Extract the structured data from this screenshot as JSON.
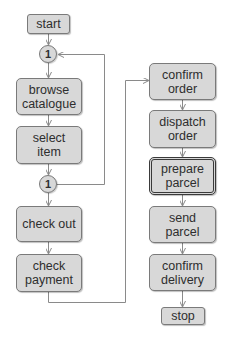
{
  "diagram": {
    "type": "flowchart",
    "colors": {
      "node_fill": "#d8d8d8",
      "node_border": "#7a7a7a",
      "text": "#2e2e2e",
      "line": "#888888"
    },
    "nodes": [
      {
        "id": "start",
        "label": "start",
        "kind": "terminal"
      },
      {
        "id": "c1",
        "label": "1",
        "kind": "connector"
      },
      {
        "id": "browse",
        "label": "browse catalogue",
        "kind": "process"
      },
      {
        "id": "select",
        "label": "select item",
        "kind": "process"
      },
      {
        "id": "c2",
        "label": "1",
        "kind": "connector"
      },
      {
        "id": "checkout",
        "label": "check out",
        "kind": "process"
      },
      {
        "id": "checkpay",
        "label": "check payment",
        "kind": "process"
      },
      {
        "id": "confirm_order",
        "label": "confirm order",
        "kind": "process"
      },
      {
        "id": "dispatch",
        "label": "dispatch order",
        "kind": "process"
      },
      {
        "id": "prepare",
        "label": "prepare parcel",
        "kind": "process",
        "highlighted": true
      },
      {
        "id": "send",
        "label": "send parcel",
        "kind": "process"
      },
      {
        "id": "confirm_delivery",
        "label": "confirm delivery",
        "kind": "process"
      },
      {
        "id": "stop",
        "label": "stop",
        "kind": "terminal"
      }
    ],
    "edges": [
      [
        "start",
        "c1"
      ],
      [
        "c1",
        "browse"
      ],
      [
        "browse",
        "select"
      ],
      [
        "select",
        "c2"
      ],
      [
        "c2",
        "c1"
      ],
      [
        "c2",
        "checkout"
      ],
      [
        "checkout",
        "checkpay"
      ],
      [
        "checkpay",
        "confirm_order"
      ],
      [
        "confirm_order",
        "dispatch"
      ],
      [
        "dispatch",
        "prepare"
      ],
      [
        "prepare",
        "send"
      ],
      [
        "send",
        "confirm_delivery"
      ],
      [
        "confirm_delivery",
        "stop"
      ]
    ]
  },
  "labels": {
    "start": "start",
    "c1": "1",
    "browse_1": "browse",
    "browse_2": "catalogue",
    "select_1": "select",
    "select_2": "item",
    "c2": "1",
    "checkout": "check out",
    "checkpay_1": "check",
    "checkpay_2": "payment",
    "confirm_order_1": "confirm",
    "confirm_order_2": "order",
    "dispatch_1": "dispatch",
    "dispatch_2": "order",
    "prepare_1": "prepare",
    "prepare_2": "parcel",
    "send_1": "send",
    "send_2": "parcel",
    "confirm_delivery_1": "confirm",
    "confirm_delivery_2": "delivery",
    "stop": "stop"
  }
}
